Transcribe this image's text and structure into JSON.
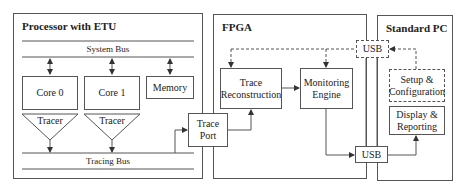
{
  "regions": {
    "processor": {
      "title": "Processor with ETU"
    },
    "fpga": {
      "title": "FPGA"
    },
    "pc": {
      "title": "Standard PC"
    }
  },
  "processor": {
    "system_bus": "System Bus",
    "tracing_bus": "Tracing Bus",
    "core0": "Core 0",
    "core1": "Core 1",
    "memory": "Memory",
    "tracer0": "Tracer",
    "tracer1": "Tracer"
  },
  "trace_port": {
    "line1": "Trace",
    "line2": "Port"
  },
  "fpga": {
    "trace_reconstruction": {
      "line1": "Trace",
      "line2": "Reconstruction"
    },
    "monitoring_engine": {
      "line1": "Monitoring",
      "line2": "Engine"
    }
  },
  "usb": {
    "top": "USB",
    "bottom": "USB"
  },
  "pc": {
    "setup": {
      "line1": "Setup &",
      "line2": "Configuration"
    },
    "display": {
      "line1": "Display &",
      "line2": "Reporting"
    }
  },
  "colors": {
    "line": "#555555",
    "background": "#ffffff",
    "text": "#222222"
  }
}
